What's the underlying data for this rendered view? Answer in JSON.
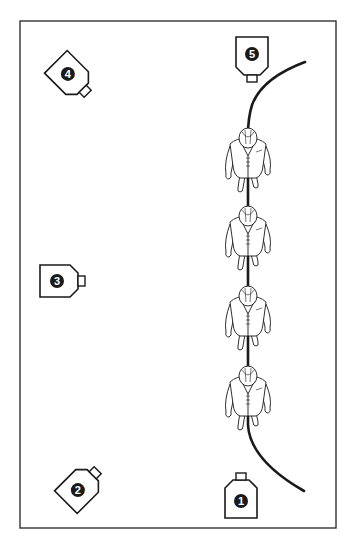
{
  "diagram": {
    "type": "camera-placement",
    "colors": {
      "ink": "#1a1a1a",
      "paper": "#ffffff",
      "frame": "#333333"
    },
    "frame": {
      "x": 20,
      "y": 21,
      "width": 316,
      "height": 507
    },
    "cameras": [
      {
        "id": "camera-1",
        "label": "1",
        "x": 241,
        "y": 498,
        "rotation": 180
      },
      {
        "id": "camera-2",
        "label": "2",
        "x": 80,
        "y": 488,
        "rotation": 225
      },
      {
        "id": "camera-3",
        "label": "3",
        "x": 60,
        "y": 281,
        "rotation": 270
      },
      {
        "id": "camera-4",
        "label": "4",
        "x": 70,
        "y": 76,
        "rotation": 315
      },
      {
        "id": "camera-5",
        "label": "5",
        "x": 252,
        "y": 57,
        "rotation": 0
      }
    ],
    "walkers": [
      {
        "id": "walker-1",
        "x": 248,
        "y": 160
      },
      {
        "id": "walker-2",
        "x": 248,
        "y": 238
      },
      {
        "id": "walker-3",
        "x": 248,
        "y": 318
      },
      {
        "id": "walker-4",
        "x": 248,
        "y": 398
      }
    ],
    "path": {
      "description": "curved walking line passing under the walkers"
    }
  }
}
